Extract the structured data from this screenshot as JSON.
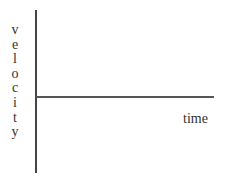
{
  "diagram": {
    "type": "axes",
    "y_axis_label": "velocity",
    "y_axis_letters": [
      "v",
      "e",
      "l",
      "o",
      "c",
      "i",
      "t",
      "y"
    ],
    "x_axis_label": "time"
  }
}
